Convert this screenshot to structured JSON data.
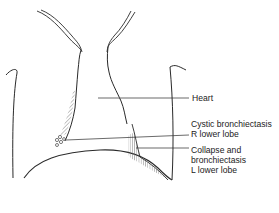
{
  "figure": {
    "labels": {
      "heart": "Heart",
      "cystic": [
        "Cystic bronchiectasis",
        "R lower lobe"
      ],
      "collapse": [
        "Collapse and",
        "bronchiectasis",
        "L lower lobe"
      ]
    },
    "colors": {
      "line": "#2a2a2a",
      "hatch": "#555555",
      "text": "#222222",
      "background": "#ffffff"
    }
  }
}
